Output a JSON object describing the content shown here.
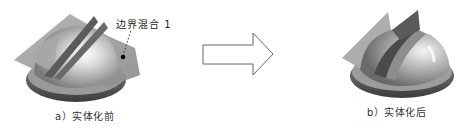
{
  "figure": {
    "left": {
      "caption": "a）实体化前",
      "callout_label": "边界混合 1"
    },
    "right": {
      "caption": "b）实体化后"
    },
    "arrow": {
      "direction": "right"
    },
    "colors": {
      "surface_gray": "#9a9a9a",
      "base_dark": "#5a5a5a",
      "dome_light": "#f2f2f2",
      "fin_dark": "#555555",
      "arrow_stroke": "#666666"
    }
  }
}
